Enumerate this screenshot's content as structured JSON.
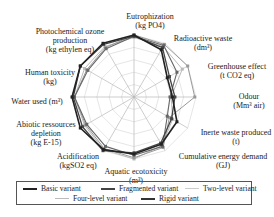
{
  "chart_data": {
    "type": "radar",
    "title": "",
    "axes": [
      "Eutrophization (kg PO4)",
      "Radioactive waste (dm³)",
      "Greenhouse effect (t CO2 eq)",
      "Odour (Mm³ air)",
      "Inerte waste produced (t)",
      "Cumulative energy demand (GJ)",
      "Aquatic ecotoxicity (m³)",
      "Acidification (kgSO2 eq)",
      "Abiotic ressources depletion (kg E-15)",
      "Water used (m³)",
      "Human toxicity (kg)",
      "Photochemical ozone production (kg ethylen eq)"
    ],
    "rmax": 1.0,
    "grid": true,
    "legend_position": "bottom",
    "series": [
      {
        "name": "Basic variant",
        "color": "#222222",
        "width": 1.6,
        "values": [
          1.0,
          0.88,
          0.62,
          0.62,
          0.8,
          0.88,
          0.92,
          0.98,
          1.0,
          1.0,
          1.0,
          1.0
        ]
      },
      {
        "name": "Fragmented variant",
        "color": "#444444",
        "width": 1.3,
        "values": [
          0.98,
          0.92,
          0.66,
          0.66,
          0.7,
          0.86,
          0.9,
          1.0,
          0.96,
          0.98,
          1.0,
          0.98
        ]
      },
      {
        "name": "Two-level variant",
        "color": "#bbbbbb",
        "width": 1.0,
        "values": [
          0.96,
          0.94,
          0.9,
          0.6,
          0.72,
          0.9,
          1.0,
          0.98,
          0.92,
          0.96,
          0.92,
          0.94
        ]
      },
      {
        "name": "Four-level variant",
        "color": "#999999",
        "width": 1.0,
        "values": [
          1.0,
          0.98,
          1.0,
          0.98,
          0.66,
          0.94,
          0.98,
          0.96,
          0.9,
          0.96,
          0.88,
          0.92
        ]
      },
      {
        "name": "Rigid variant",
        "color": "#666666",
        "width": 1.1,
        "values": [
          0.98,
          0.96,
          0.8,
          0.58,
          0.62,
          0.92,
          0.94,
          0.92,
          0.88,
          0.96,
          0.86,
          0.9
        ]
      }
    ]
  },
  "labels": [
    {
      "text": [
        "Eutrophization",
        "(kg PO4)"
      ],
      "x": 150,
      "y": 12
    },
    {
      "text": [
        "Radioactive waste",
        "(dm³)"
      ],
      "x": 203,
      "y": 34
    },
    {
      "text": [
        "Greenhouse effect",
        "(t CO2 eq)"
      ],
      "x": 237,
      "y": 62
    },
    {
      "text": [
        "Odour",
        "(Mm³ air)"
      ],
      "x": 249,
      "y": 92
    },
    {
      "text": [
        "Inerte waste produced",
        "(t)"
      ],
      "x": 236,
      "y": 128
    },
    {
      "text": [
        "Cumulative energy demand",
        "(GJ)"
      ],
      "x": 223,
      "y": 152
    },
    {
      "text": [
        "Aquatic ecotoxicity",
        "(m³)"
      ],
      "x": 136,
      "y": 167
    },
    {
      "text": [
        "Acidification",
        "(kgSO2 eq)"
      ],
      "x": 78,
      "y": 152
    },
    {
      "text": [
        "Abiotic ressources",
        "depletion",
        "(kg E-15)"
      ],
      "x": 46,
      "y": 120
    },
    {
      "text": [
        "Water used (m³)"
      ],
      "x": 37,
      "y": 97
    },
    {
      "text": [
        "Human toxicity",
        "(kg)"
      ],
      "x": 50,
      "y": 68
    },
    {
      "text": [
        "Photochemical ozone",
        "production",
        "(kg ethylen eq)"
      ],
      "x": 70,
      "y": 27
    }
  ],
  "legend": {
    "items": [
      {
        "label": "Basic variant",
        "color": "#222222"
      },
      {
        "label": "Fragmented variant",
        "color": "#444444"
      },
      {
        "label": "Two-level variant",
        "color": "#cccccc"
      },
      {
        "label": "Four-level variant",
        "color": "#bbbbbb"
      },
      {
        "label": "Rigid variant",
        "color": "#333333"
      }
    ]
  }
}
